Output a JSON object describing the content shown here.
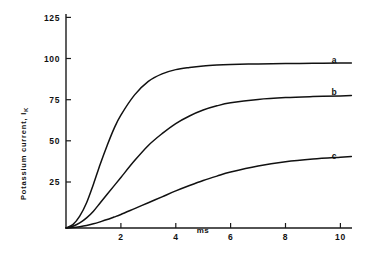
{
  "chart_data": {
    "type": "line",
    "title": "",
    "xlabel": "ms",
    "ylabel": "Potassium current, I_K",
    "ylabel_main": "Potassium current, I",
    "ylabel_sub": "K",
    "xlim": [
      0,
      10.6
    ],
    "ylim": [
      0,
      130
    ],
    "grid": false,
    "legend_position": "right-inline",
    "xticks": [
      2,
      4,
      6,
      8,
      10
    ],
    "xticklabels": [
      "2",
      "4",
      "6",
      "8",
      "10"
    ],
    "yticks": [
      25,
      50,
      75,
      100,
      125
    ],
    "yticklabels": [
      "25",
      "50",
      "75",
      "100",
      "125"
    ],
    "x": [
      0,
      0.25,
      0.5,
      0.75,
      1.0,
      1.25,
      1.5,
      1.75,
      2.0,
      2.5,
      3.0,
      3.5,
      4.0,
      4.5,
      5.0,
      5.5,
      6.0,
      7.0,
      8.0,
      9.0,
      10.0,
      10.4
    ],
    "series": [
      {
        "name": "a",
        "label": "a",
        "color": "#111111",
        "values": [
          0,
          2,
          7,
          15,
          26,
          38,
          49,
          59,
          67,
          79,
          87,
          91.5,
          94,
          95.3,
          96.2,
          96.7,
          97.0,
          97.4,
          97.6,
          97.8,
          97.9,
          98.0
        ]
      },
      {
        "name": "b",
        "label": "b",
        "color": "#111111",
        "values": [
          0,
          1,
          3,
          6,
          10,
          15,
          20,
          25,
          30,
          40,
          49,
          56,
          62,
          66.5,
          70,
          72.5,
          74.3,
          76.3,
          77.4,
          78.0,
          78.4,
          78.6
        ]
      },
      {
        "name": "c",
        "label": "c",
        "color": "#111111",
        "values": [
          0,
          0.3,
          0.8,
          1.5,
          2.5,
          3.7,
          5.0,
          6.5,
          8.0,
          11.5,
          15.0,
          18.5,
          22.0,
          25.2,
          28.2,
          30.8,
          33.2,
          36.8,
          39.3,
          40.9,
          42.0,
          42.4
        ]
      }
    ]
  }
}
